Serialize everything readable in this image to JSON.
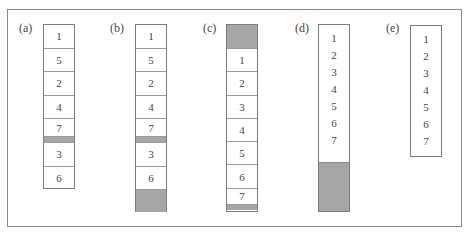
{
  "figure": {
    "panels": [
      {
        "id": "a",
        "label": "(a)",
        "cells": [
          {
            "text": "1",
            "type": "slot"
          },
          {
            "text": "5",
            "type": "slot"
          },
          {
            "text": "2",
            "type": "slot"
          },
          {
            "text": "4",
            "type": "slot"
          },
          {
            "text": "7",
            "type": "slot"
          },
          {
            "text": "",
            "type": "gap"
          },
          {
            "text": "3",
            "type": "slot"
          },
          {
            "text": "6",
            "type": "slot"
          }
        ]
      },
      {
        "id": "b",
        "label": "(b)",
        "cells": [
          {
            "text": "1",
            "type": "slot"
          },
          {
            "text": "5",
            "type": "slot"
          },
          {
            "text": "2",
            "type": "slot"
          },
          {
            "text": "4",
            "type": "slot"
          },
          {
            "text": "7",
            "type": "slot"
          },
          {
            "text": "",
            "type": "gap"
          },
          {
            "text": "3",
            "type": "slot"
          },
          {
            "text": "6",
            "type": "slot"
          },
          {
            "text": "",
            "type": "free"
          }
        ]
      },
      {
        "id": "c",
        "label": "(c)",
        "cells": [
          {
            "text": "",
            "type": "free"
          },
          {
            "text": "1",
            "type": "slot"
          },
          {
            "text": "2",
            "type": "slot"
          },
          {
            "text": "3",
            "type": "slot"
          },
          {
            "text": "4",
            "type": "slot"
          },
          {
            "text": "5",
            "type": "slot"
          },
          {
            "text": "6",
            "type": "slot"
          },
          {
            "text": "7",
            "type": "slot"
          },
          {
            "text": "",
            "type": "gap"
          }
        ]
      },
      {
        "id": "d",
        "label": "(d)",
        "items": [
          "1",
          "2",
          "3",
          "4",
          "5",
          "6",
          "7"
        ],
        "free_space": true
      },
      {
        "id": "e",
        "label": "(e)",
        "items": [
          "1",
          "2",
          "3",
          "4",
          "5",
          "6",
          "7"
        ],
        "free_space": false
      }
    ],
    "colors": {
      "free_fill": "#a6a6a6",
      "border": "#7d7d7d"
    }
  }
}
